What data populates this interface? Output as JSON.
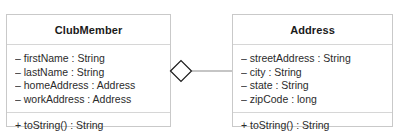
{
  "diagram": {
    "type": "uml-class-diagram",
    "background_color": "#ffffff",
    "border_color": "#c9c9c9",
    "text_color": "#2b2b2b",
    "classes": [
      {
        "id": "clubmember",
        "name": "ClubMember",
        "attributes": [
          "– firstName : String",
          "– lastName : String",
          "– homeAddress : Address",
          "– workAddress : Address"
        ],
        "methods": [
          "+ toString() : String"
        ]
      },
      {
        "id": "address",
        "name": "Address",
        "attributes": [
          "– streetAddress : String",
          "– city : String",
          "– state : String",
          "– zipCode : long"
        ],
        "methods": [
          "+ toString() : String"
        ]
      }
    ],
    "relationship": {
      "kind": "aggregation",
      "marker": "hollow-diamond",
      "source": "ClubMember",
      "target": "Address",
      "line_color": "#8c8c8c",
      "marker_color": "#1a1a1a",
      "source_label": "",
      "target_label": ""
    }
  }
}
